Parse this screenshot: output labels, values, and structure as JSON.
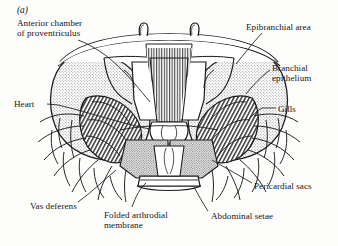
{
  "figure": {
    "panel_tag": "(a)",
    "ink_color": "#161616",
    "paper_color": "#fdfdfc",
    "shading_color": "#b9b9b9"
  },
  "labels": {
    "anterior_chamber": "Anterior chamber\nof proventriculus",
    "heart": "Heart",
    "vas_deferens": "Vas deferens",
    "folded_membrane": "Folded arthrodial\nmembrane",
    "abdominal_setae": "Abdominal setae",
    "pericardial_sacs": "Pericardial sacs",
    "gills": "Gills",
    "branchial_epithelium": "Branchial\nepithelium",
    "epibranchial_area": "Epibranchial area"
  }
}
